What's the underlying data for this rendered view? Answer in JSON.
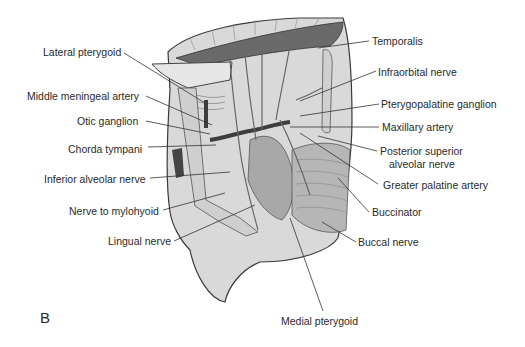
{
  "figure": {
    "panel_letter": "B",
    "labels_left": [
      {
        "text": "Lateral pterygoid",
        "x": 43,
        "y": 46,
        "line": [
          124,
          53,
          205,
          103
        ]
      },
      {
        "text": "Middle meningeal artery",
        "x": 27,
        "y": 90,
        "line": [
          146,
          96,
          212,
          125
        ]
      },
      {
        "text": "Otic ganglion",
        "x": 77,
        "y": 115,
        "line": [
          146,
          121,
          210,
          134
        ]
      },
      {
        "text": "Chorda tympani",
        "x": 68,
        "y": 143,
        "line": [
          148,
          147,
          216,
          145
        ]
      },
      {
        "text": "Inferior alveolar nerve",
        "x": 44,
        "y": 173,
        "line": [
          150,
          178,
          230,
          172
        ]
      },
      {
        "text": "Nerve to mylohyoid",
        "x": 69,
        "y": 205,
        "line": [
          163,
          210,
          225,
          193
        ]
      },
      {
        "text": "Lingual nerve",
        "x": 108,
        "y": 235,
        "line": [
          174,
          241,
          255,
          205
        ]
      }
    ],
    "labels_right": [
      {
        "text": "Temporalis",
        "x": 372,
        "y": 35,
        "line": [
          369,
          41,
          318,
          48
        ]
      },
      {
        "text": "Infraorbital nerve",
        "x": 378,
        "y": 66,
        "line": [
          376,
          71,
          300,
          101
        ]
      },
      {
        "text": "Pterygopalatine ganglion",
        "x": 381,
        "y": 98,
        "line": [
          379,
          104,
          300,
          116
        ]
      },
      {
        "text": "Maxillary artery",
        "x": 382,
        "y": 121,
        "line": [
          379,
          127,
          290,
          127
        ]
      },
      {
        "text": "Posterior superior",
        "x": 380,
        "y": 145,
        "line": [
          377,
          151,
          318,
          136
        ]
      },
      {
        "text": "alveolar nerve",
        "x": 389,
        "y": 158,
        "line": null
      },
      {
        "text": "Greater palatine artery",
        "x": 383,
        "y": 179,
        "line": [
          378,
          184,
          300,
          133
        ]
      },
      {
        "text": "Buccinator",
        "x": 372,
        "y": 206,
        "line": [
          369,
          212,
          338,
          178
        ]
      },
      {
        "text": "Buccal nerve",
        "x": 358,
        "y": 236,
        "line": [
          356,
          242,
          322,
          222
        ]
      },
      {
        "text": "Medial pterygoid",
        "x": 281,
        "y": 315,
        "line": [
          323,
          311,
          290,
          218
        ]
      }
    ]
  }
}
